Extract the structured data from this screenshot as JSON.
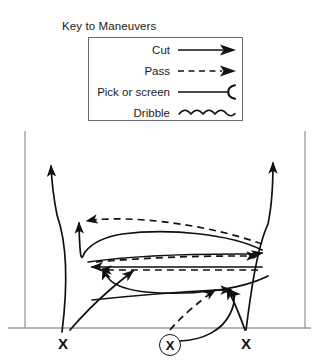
{
  "legend": {
    "title": "Key to Maneuvers",
    "rows": [
      {
        "label": "Cut",
        "glyph": "solid-arrow-icon"
      },
      {
        "label": "Pass",
        "glyph": "dashed-arrow-icon"
      },
      {
        "label": "Pick or screen",
        "glyph": "line-hook-icon"
      },
      {
        "label": "Dribble",
        "glyph": "wavy-line-icon"
      }
    ]
  },
  "court": {
    "players": [
      {
        "label": "X",
        "circled": false,
        "x": 58,
        "y": 336
      },
      {
        "label": "X",
        "circled": true,
        "x": 159,
        "y": 334
      },
      {
        "label": "X",
        "circled": false,
        "x": 241,
        "y": 336
      }
    ]
  },
  "colors": {
    "stroke": "#111111",
    "court_line": "#9a9aa0",
    "legend_border": "#6b6b72",
    "text": "#1a1a1a",
    "background": "#ffffff"
  }
}
